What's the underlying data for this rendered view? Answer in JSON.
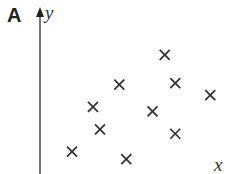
{
  "panel_label": "A",
  "chart_data": {
    "type": "scatter",
    "title": "",
    "panel": "A",
    "xlabel": "x",
    "ylabel": "y",
    "grid": false,
    "legend": null,
    "marker": "x",
    "marker_color": "#333333",
    "axis_color": "#555555",
    "x_ticks": [],
    "y_ticks": [],
    "xlim": [
      0,
      10
    ],
    "ylim": [
      0,
      10
    ],
    "points": [
      {
        "x": 1.6,
        "y": 1.5
      },
      {
        "x": 4.7,
        "y": 1.0
      },
      {
        "x": 3.2,
        "y": 3.0
      },
      {
        "x": 7.5,
        "y": 2.7
      },
      {
        "x": 2.8,
        "y": 4.5
      },
      {
        "x": 6.2,
        "y": 4.2
      },
      {
        "x": 4.3,
        "y": 6.0
      },
      {
        "x": 7.5,
        "y": 6.1
      },
      {
        "x": 9.5,
        "y": 5.3
      },
      {
        "x": 6.9,
        "y": 8.0
      }
    ]
  }
}
